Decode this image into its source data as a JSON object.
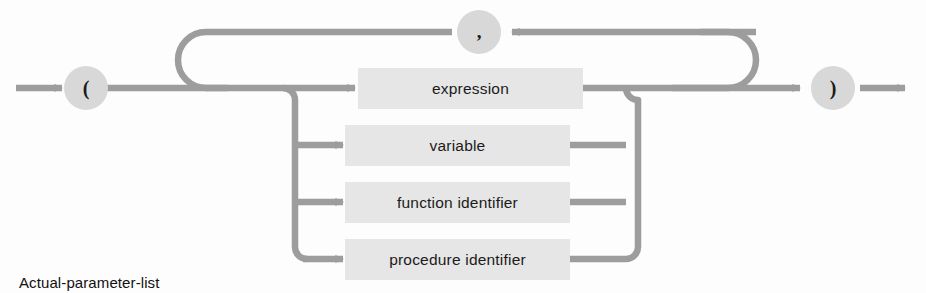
{
  "diagram": {
    "kind": "railroad-syntax-diagram",
    "caption": "Actual-parameter-list",
    "colors": {
      "rail": "#9d9d9d",
      "node_fill": "#d8d8d8",
      "box_fill": "#e6e6e6",
      "text": "#1b1b1b",
      "background": "#fdfdfd"
    },
    "terminals": [
      {
        "id": "open-paren",
        "label": "("
      },
      {
        "id": "comma",
        "label": ","
      },
      {
        "id": "close-paren",
        "label": ")"
      }
    ],
    "nonterminals": [
      {
        "id": "expression",
        "label": "expression"
      },
      {
        "id": "variable",
        "label": "variable"
      },
      {
        "id": "function-identifier",
        "label": "function identifier"
      },
      {
        "id": "procedure-identifier",
        "label": "procedure identifier"
      }
    ],
    "structure": {
      "entry": "(",
      "choice_of": [
        "expression",
        "variable",
        "function identifier",
        "procedure identifier"
      ],
      "repeat_separator": ",",
      "exit": ")"
    }
  }
}
